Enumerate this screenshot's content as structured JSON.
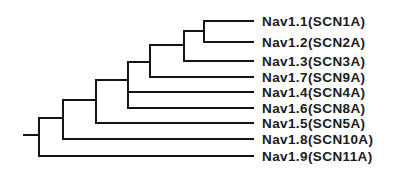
{
  "diagram": {
    "type": "phylogenetic-tree",
    "line_color": "#141414",
    "text_color": "#1a1a1a",
    "background": "#ffffff",
    "root": {
      "stub_x1": 24,
      "stub_x2": 39,
      "y": 135
    },
    "leaf_end_x": 253,
    "label_x": 262,
    "leaves": [
      {
        "id": "nav11",
        "label": "Nav1.1(SCN1A)",
        "y": 21
      },
      {
        "id": "nav12",
        "label": "Nav1.2(SCN2A)",
        "y": 42
      },
      {
        "id": "nav13",
        "label": "Nav1.3(SCN3A)",
        "y": 61
      },
      {
        "id": "nav17",
        "label": "Nav1.7(SCN9A)",
        "y": 77
      },
      {
        "id": "nav14",
        "label": "Nav1.4(SCN4A)",
        "y": 92
      },
      {
        "id": "nav16",
        "label": "Nav1.6(SCN8A)",
        "y": 108
      },
      {
        "id": "nav15",
        "label": "Nav1.5(SCN5A)",
        "y": 123
      },
      {
        "id": "nav18",
        "label": "Nav1.8(SCN10A)",
        "y": 139
      },
      {
        "id": "nav19",
        "label": "Nav1.9(SCN11A)",
        "y": 156
      }
    ],
    "nodes": [
      {
        "id": "n0",
        "x": 39,
        "y_top": 118,
        "y_bottom": 156,
        "children_y": [
          118,
          156
        ]
      },
      {
        "id": "n1",
        "x": 63,
        "y_top": 100,
        "y_bottom": 139,
        "children_y": [
          100,
          139
        ]
      },
      {
        "id": "n2",
        "x": 96,
        "y_top": 80,
        "y_bottom": 123,
        "children_y": [
          80,
          123
        ]
      },
      {
        "id": "n3",
        "x": 128,
        "y_top": 62,
        "y_bottom": 108,
        "children_y": [
          62,
          92,
          108
        ]
      },
      {
        "id": "n4",
        "x": 150,
        "y_top": 45,
        "y_bottom": 77,
        "children_y": [
          45,
          77
        ]
      },
      {
        "id": "n5",
        "x": 184,
        "y_top": 31,
        "y_bottom": 61,
        "children_y": [
          31,
          61
        ]
      },
      {
        "id": "n6",
        "x": 204,
        "y_top": 21,
        "y_bottom": 42,
        "children_y": [
          21,
          42
        ]
      }
    ],
    "internal_branches": [
      {
        "from_node": "n0",
        "to_x": 63,
        "y": 118
      },
      {
        "from_node": "n1",
        "to_x": 96,
        "y": 100
      },
      {
        "from_node": "n2",
        "to_x": 128,
        "y": 80
      },
      {
        "from_node": "n3",
        "to_x": 150,
        "y": 62
      },
      {
        "from_node": "n4",
        "to_x": 184,
        "y": 45
      },
      {
        "from_node": "n5",
        "to_x": 204,
        "y": 31
      }
    ],
    "leaf_branches": [
      {
        "leaf": "nav11",
        "from_x": 204,
        "y": 21
      },
      {
        "leaf": "nav12",
        "from_x": 204,
        "y": 42
      },
      {
        "leaf": "nav13",
        "from_x": 184,
        "y": 61
      },
      {
        "leaf": "nav17",
        "from_x": 150,
        "y": 77
      },
      {
        "leaf": "nav14",
        "from_x": 128,
        "y": 92
      },
      {
        "leaf": "nav16",
        "from_x": 128,
        "y": 108
      },
      {
        "leaf": "nav15",
        "from_x": 96,
        "y": 123
      },
      {
        "leaf": "nav18",
        "from_x": 63,
        "y": 139
      },
      {
        "leaf": "nav19",
        "from_x": 39,
        "y": 156
      }
    ]
  }
}
